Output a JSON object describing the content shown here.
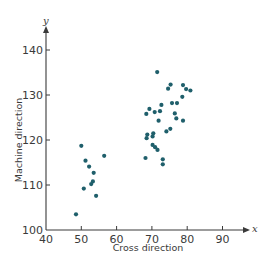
{
  "chart_data": {
    "type": "scatter",
    "title": "",
    "xlabel": "Cross direction",
    "ylabel": "Machine direction",
    "x_axis_var": "x",
    "y_axis_var": "y",
    "xlim": [
      40,
      95
    ],
    "ylim": [
      100,
      145
    ],
    "xticks": [
      40,
      50,
      60,
      70,
      80,
      90
    ],
    "yticks": [
      100,
      110,
      120,
      130,
      140
    ],
    "grid": false,
    "legend": null,
    "marker_color": "#1f5f6b",
    "series": [
      {
        "name": "observations",
        "points": [
          [
            50.0,
            118.7
          ],
          [
            56.5,
            116.5
          ],
          [
            51.2,
            115.4
          ],
          [
            52.2,
            114.1
          ],
          [
            53.5,
            112.7
          ],
          [
            53.3,
            110.8
          ],
          [
            52.8,
            110.2
          ],
          [
            50.7,
            109.2
          ],
          [
            54.2,
            107.6
          ],
          [
            48.5,
            103.5
          ],
          [
            71.5,
            135.1
          ],
          [
            75.3,
            132.3
          ],
          [
            74.6,
            131.4
          ],
          [
            78.8,
            132.2
          ],
          [
            79.7,
            131.3
          ],
          [
            80.9,
            131.0
          ],
          [
            78.6,
            129.6
          ],
          [
            72.7,
            127.8
          ],
          [
            75.7,
            128.2
          ],
          [
            77.1,
            128.2
          ],
          [
            69.3,
            126.9
          ],
          [
            68.4,
            125.8
          ],
          [
            70.8,
            126.2
          ],
          [
            72.3,
            126.4
          ],
          [
            76.5,
            125.9
          ],
          [
            71.9,
            124.3
          ],
          [
            76.9,
            124.8
          ],
          [
            78.8,
            124.3
          ],
          [
            75.2,
            122.5
          ],
          [
            74.1,
            121.9
          ],
          [
            70.4,
            121.5
          ],
          [
            70.2,
            120.8
          ],
          [
            68.7,
            121.2
          ],
          [
            68.5,
            120.4
          ],
          [
            70.2,
            118.9
          ],
          [
            70.9,
            118.4
          ],
          [
            71.6,
            117.8
          ],
          [
            68.2,
            116.0
          ],
          [
            73.1,
            115.7
          ],
          [
            73.1,
            114.6
          ]
        ]
      }
    ]
  }
}
